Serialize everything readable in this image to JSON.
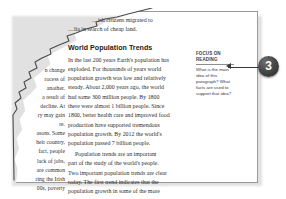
{
  "document": {
    "section_heading": "World Population Trends",
    "intro_fragment_lines": [
      "…ish citizens migrated to",
      "…lia in search of cheap land."
    ],
    "body_lines": [
      "In the last 200 years Earth's population has",
      "exploded. For thousands of years world",
      "population growth was low and relatively",
      "steady. About 2,000 years ago, the world",
      "had some 300 million people. By 1800",
      "there were almost 1 billion people. Since",
      "1800, better health care and improved food",
      "production have supported tremendous",
      "population growth. By 2012 the world's",
      "population passed 7 billion people.",
      "Population trends are an important",
      "part of the study of the world's people.",
      "Two important population trends are clear",
      "today. The first trend indicates that the",
      "population growth in some of the more"
    ],
    "torn_column_fragment_lines": [
      "n change",
      "rocess of",
      "another.",
      "a result of",
      "decline. At",
      "ry may gain",
      "re.",
      "asons. Some",
      "heir country,",
      "fact, people",
      "lack of jobs,",
      "are common",
      "ring the Irish",
      "00s, poverty"
    ]
  },
  "sidebar_callout": {
    "kicker_line_1": "FOCUS ON",
    "kicker_line_2": "READING",
    "body_lines": [
      "What is the main",
      "idea of this",
      "paragraph? What",
      "facts are used to",
      "support that idea?"
    ]
  },
  "annotation": {
    "badge_number": "3",
    "badge_color": "#2b2b2b",
    "leader_color": "#3a3a3a"
  }
}
